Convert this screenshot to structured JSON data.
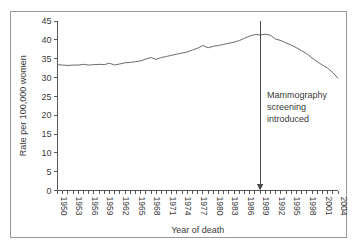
{
  "chart_data": {
    "type": "line",
    "title": "",
    "xlabel": "Year of death",
    "ylabel": "Rate per 100,000 women",
    "xlim": [
      1950,
      2004
    ],
    "ylim": [
      0,
      45
    ],
    "ytick_step": 5,
    "xtick_step": 3,
    "minor_xticks": "yearly",
    "grid": false,
    "legend": "none",
    "yticks": [
      0,
      5,
      10,
      15,
      20,
      25,
      30,
      35,
      40,
      45
    ],
    "ytick_labels": [
      "0",
      "5",
      "10",
      "15",
      "20",
      "25",
      "30",
      "35",
      "40",
      "45"
    ],
    "xticks": [
      1950,
      1953,
      1956,
      1959,
      1962,
      1965,
      1968,
      1971,
      1974,
      1977,
      1980,
      1983,
      1986,
      1989,
      1992,
      1995,
      1998,
      2001,
      2004
    ],
    "xtick_labels": [
      "1950",
      "1953",
      "1956",
      "1959",
      "1962",
      "1965",
      "1968",
      "1971",
      "1974",
      "1977",
      "1980",
      "1983",
      "1986",
      "1989",
      "1992",
      "1995",
      "1998",
      "2001",
      "2004"
    ],
    "x": [
      1950,
      1951,
      1952,
      1953,
      1954,
      1955,
      1956,
      1957,
      1958,
      1959,
      1960,
      1961,
      1962,
      1963,
      1964,
      1965,
      1966,
      1967,
      1968,
      1969,
      1970,
      1971,
      1972,
      1973,
      1974,
      1975,
      1976,
      1977,
      1978,
      1979,
      1980,
      1981,
      1982,
      1983,
      1984,
      1985,
      1986,
      1987,
      1988,
      1989,
      1990,
      1991,
      1992,
      1993,
      1994,
      1995,
      1996,
      1997,
      1998,
      1999,
      2000,
      2001,
      2002,
      2003,
      2004
    ],
    "values": [
      33.4,
      33.3,
      33.2,
      33.3,
      33.3,
      33.5,
      33.3,
      33.4,
      33.5,
      33.4,
      33.8,
      33.3,
      33.6,
      33.9,
      34.0,
      34.2,
      34.4,
      34.9,
      35.3,
      34.8,
      35.3,
      35.6,
      35.9,
      36.2,
      36.5,
      36.8,
      37.3,
      37.8,
      38.5,
      37.9,
      38.3,
      38.5,
      38.8,
      39.1,
      39.4,
      39.8,
      40.4,
      41.0,
      41.4,
      41.3,
      41.5,
      41.2,
      40.2,
      39.8,
      39.2,
      38.6,
      37.9,
      37.1,
      36.3,
      35.2,
      34.2,
      33.3,
      32.5,
      31.3,
      29.8
    ],
    "annotations": [
      {
        "name": "mammography-screening-introduced",
        "x": 1989,
        "lines": [
          "Mammography",
          "screening",
          "introduced"
        ],
        "marker": "vertical-arrow-down"
      }
    ],
    "series": [
      {
        "name": "breast-cancer-mortality-rate",
        "color": "#6b6b6b"
      }
    ]
  }
}
